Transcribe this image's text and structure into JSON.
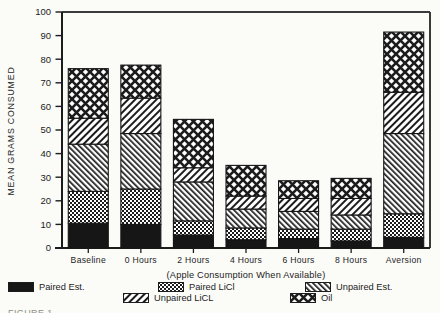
{
  "colors": {
    "ink": "#1c1c1c",
    "paper": "#fbfbf8"
  },
  "caption_fragment": "FIGURE 1.",
  "chart_data": {
    "type": "bar",
    "stacked": true,
    "title": "",
    "xlabel": "(Apple Consumption When Available)",
    "ylabel": "MEAN GRAMS CONSUMED",
    "ylim": [
      0,
      100
    ],
    "ytick_step": 10,
    "grid": false,
    "legend_position": "bottom",
    "categories": [
      "Baseline",
      "0 Hours",
      "2 Hours",
      "4 Hours",
      "6 Hours",
      "8 Hours",
      "Aversion"
    ],
    "series": [
      {
        "name": "Paired Est.",
        "pattern": "solid",
        "values": [
          10.5,
          10,
          5.5,
          3.5,
          4,
          3,
          4.5
        ]
      },
      {
        "name": "Paired LiCl",
        "pattern": "dots",
        "values": [
          13.5,
          15,
          6,
          5,
          4,
          5,
          10
        ]
      },
      {
        "name": "Unpaired Est.",
        "pattern": "hatch-fwd",
        "values": [
          20,
          23.5,
          16.5,
          8,
          7.5,
          6,
          34
        ]
      },
      {
        "name": "Unpaired LiCL",
        "pattern": "hatch-back",
        "values": [
          11,
          15,
          6,
          5.5,
          5.5,
          7,
          17.5
        ]
      },
      {
        "name": "Oil",
        "pattern": "diamond",
        "values": [
          21,
          14,
          20.5,
          13,
          7.5,
          8.5,
          25.5
        ]
      }
    ],
    "totals": [
      76,
      77.5,
      54.5,
      35,
      28.5,
      29.5,
      91.5
    ]
  }
}
